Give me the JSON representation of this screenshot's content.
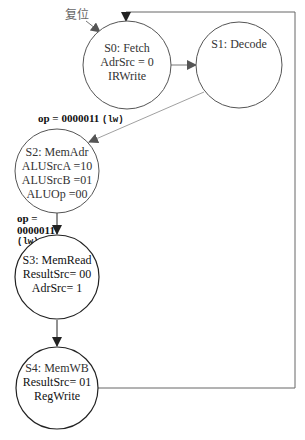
{
  "reset_label": "复位",
  "states": [
    {
      "id": "S0",
      "cx": 127,
      "cy": 65,
      "r": 44,
      "stroke": "#555",
      "lines": [
        "S0: Fetch",
        "AdrSrc = 0",
        "IRWrite"
      ]
    },
    {
      "id": "S1",
      "cx": 239,
      "cy": 65,
      "r": 43,
      "stroke": "#555",
      "lines": [
        "S1: Decode"
      ]
    },
    {
      "id": "S2",
      "cx": 57,
      "cy": 171,
      "r": 42,
      "stroke": "#555",
      "lines": [
        "S2: MemAdr",
        "ALUSrcA =10",
        "ALUSrcB =01",
        "ALUOp =00"
      ]
    },
    {
      "id": "S3",
      "cx": 57,
      "cy": 277,
      "r": 42,
      "stroke": "#222",
      "lines": [
        "S3: MemRead",
        "ResultSrc= 00",
        "AdrSrc= 1"
      ]
    },
    {
      "id": "S4",
      "cx": 57,
      "cy": 388,
      "r": 41,
      "stroke": "#222",
      "lines": [
        "S4: MemWB",
        "ResultSrc= 01",
        "RegWrite"
      ]
    }
  ],
  "transitions": {
    "s1_to_s2": {
      "cond_main": "op = 0000011 ",
      "cond_mono": "(lw)"
    },
    "s2_to_s3": {
      "line1": "op =",
      "line2": "0000011",
      "line3": "(lw)"
    }
  }
}
